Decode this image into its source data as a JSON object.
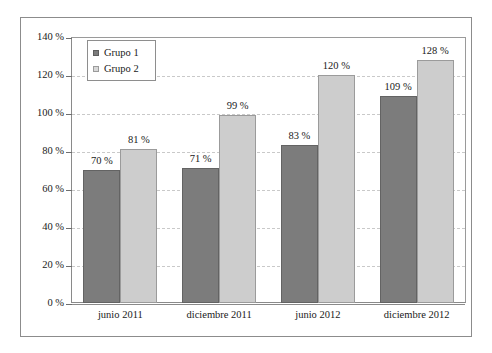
{
  "chart_data": {
    "type": "bar",
    "title": "",
    "subtitle": "",
    "xlabel": "",
    "ylabel": "",
    "categories": [
      "junio 2011",
      "diciembre 2011",
      "junio 2012",
      "diciembre 2012"
    ],
    "series": [
      {
        "name": "Grupo 1",
        "values": [
          70,
          71,
          83,
          109
        ],
        "color": "#7c7c7c"
      },
      {
        "name": "Grupo 2",
        "values": [
          81,
          99,
          120,
          128
        ],
        "color": "#cdcdcd"
      }
    ],
    "value_labels": [
      [
        "70 %",
        "81 %"
      ],
      [
        "71 %",
        "99 %"
      ],
      [
        "83 %",
        "120 %"
      ],
      [
        "109 %",
        "128 %"
      ]
    ],
    "ylim": [
      0,
      140
    ],
    "yticks": [
      0,
      20,
      40,
      60,
      80,
      100,
      120,
      140
    ],
    "ytick_labels": [
      "0 %",
      "20 %",
      "40 %",
      "60 %",
      "80 %",
      "100 %",
      "120 %",
      "140 %"
    ],
    "grid": "horizontal-dashed",
    "legend_position": "top-left",
    "units": "%"
  },
  "legend": {
    "items": [
      {
        "label": "Grupo 1",
        "swatch": "dark-gray-square"
      },
      {
        "label": "Grupo 2",
        "swatch": "light-gray-square"
      }
    ]
  }
}
